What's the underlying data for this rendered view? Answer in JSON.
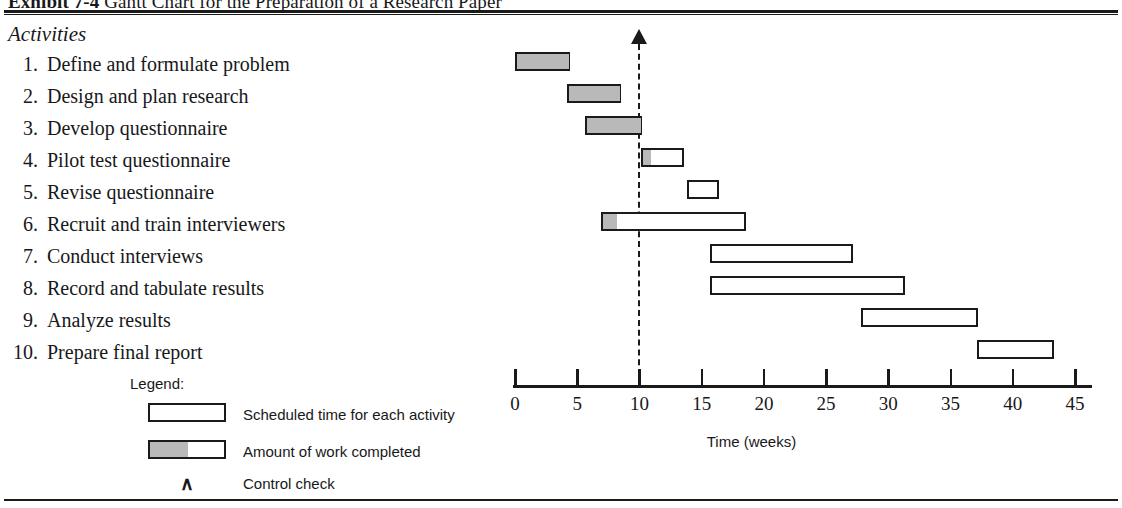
{
  "exhibit": {
    "number": "Exhibit 7-4",
    "caption": "Gantt Chart for the Preparation of a Research Paper"
  },
  "activities_heading": "Activities",
  "chart_data": {
    "type": "bar",
    "title": "Gantt Chart for the Preparation of a Research Paper",
    "xlabel": "Time (weeks)",
    "ylabel": "Activities",
    "xlim": [
      0,
      45
    ],
    "xticks": [
      0,
      5,
      10,
      15,
      20,
      25,
      30,
      35,
      40,
      45
    ],
    "xticklabels": [
      "0",
      "5",
      "10",
      "15",
      "20",
      "25",
      "30",
      "35",
      "40",
      "45"
    ],
    "grid": false,
    "control_check_week": 10,
    "categories": [
      "Define and formulate problem",
      "Design and plan research",
      "Develop questionnaire",
      "Pilot test questionnaire",
      "Revise questionnaire",
      "Recruit and train interviewers",
      "Conduct interviews",
      "Record and tabulate results",
      "Analyze results",
      "Prepare final report"
    ],
    "tasks": [
      {
        "index": "1.",
        "label": "Define and formulate problem",
        "start": 0,
        "end": 4.4,
        "completed_to": 4.4
      },
      {
        "index": "2.",
        "label": "Design and plan research",
        "start": 4.2,
        "end": 8.5,
        "completed_to": 8.5
      },
      {
        "index": "3.",
        "label": "Develop questionnaire",
        "start": 5.6,
        "end": 10.2,
        "completed_to": 10.2
      },
      {
        "index": "4.",
        "label": "Pilot test questionnaire",
        "start": 10.1,
        "end": 13.6,
        "completed_to": 11.0
      },
      {
        "index": "5.",
        "label": "Revise questionnaire",
        "start": 13.8,
        "end": 16.4,
        "completed_to": 13.8
      },
      {
        "index": "6.",
        "label": "Recruit and train interviewers",
        "start": 6.9,
        "end": 18.6,
        "completed_to": 8.2
      },
      {
        "index": "7.",
        "label": "Conduct interviews",
        "start": 15.7,
        "end": 27.2,
        "completed_to": 15.7
      },
      {
        "index": "8.",
        "label": "Record and tabulate results",
        "start": 15.7,
        "end": 31.3,
        "completed_to": 15.7
      },
      {
        "index": "9.",
        "label": "Analyze results",
        "start": 27.8,
        "end": 37.2,
        "completed_to": 27.8
      },
      {
        "index": "10.",
        "label": "Prepare final report",
        "start": 37.1,
        "end": 43.3,
        "completed_to": 37.1
      }
    ]
  },
  "legend": {
    "title": "Legend:",
    "scheduled_label": "Scheduled time for each activity",
    "completed_label": "Amount of work completed",
    "control_label": "Control check",
    "control_glyph": "∧"
  },
  "colors": {
    "ink": "#1a1a1a",
    "completed_fill": "#b9b9b9",
    "scheduled_fill": "#ffffff",
    "page": "#ffffff"
  }
}
